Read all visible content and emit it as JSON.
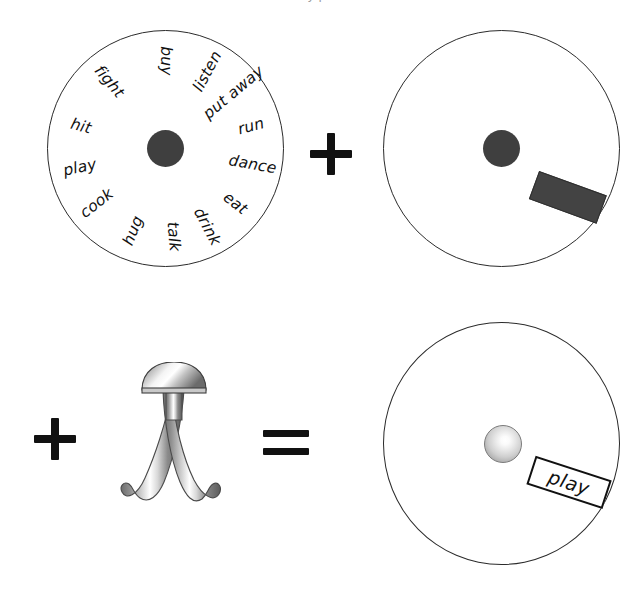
{
  "figure": {
    "caption_fragment": "y p t",
    "background_color": "#ffffff",
    "ink_color": "#111111"
  },
  "operators": {
    "plus_top": "+",
    "plus_bottom": "+",
    "equals": "="
  },
  "panels": {
    "verb_wheel": {
      "name": "verb-wheel",
      "hub_color": "#3f3f3f",
      "words": [
        {
          "label": "buy",
          "angle_deg": -90,
          "flip": true
        },
        {
          "label": "listen",
          "angle_deg": -62,
          "flip": false
        },
        {
          "label": "put away",
          "angle_deg": -40,
          "flip": false
        },
        {
          "label": "run",
          "angle_deg": -15,
          "flip": false
        },
        {
          "label": "dance",
          "angle_deg": 10,
          "flip": false
        },
        {
          "label": "eat",
          "angle_deg": 38,
          "flip": false
        },
        {
          "label": "drink",
          "angle_deg": 62,
          "flip": false
        },
        {
          "label": "talk",
          "angle_deg": 85,
          "flip": false
        },
        {
          "label": "hug",
          "angle_deg": 112,
          "flip": true
        },
        {
          "label": "cook",
          "angle_deg": 142,
          "flip": true
        },
        {
          "label": "play",
          "angle_deg": 168,
          "flip": true
        },
        {
          "label": "hit",
          "angle_deg": -165,
          "flip": true
        },
        {
          "label": "fight",
          "angle_deg": -130,
          "flip": true
        }
      ]
    },
    "pointer_disc": {
      "name": "pointer-disc",
      "hub_color": "#3f3f3f",
      "tile_color": "#434343",
      "tile_rotation_deg": 20
    },
    "hook_tool": {
      "name": "hook-tool",
      "description": "two-pronged metallic hook with dome cap"
    },
    "result_disc": {
      "name": "result-disc",
      "hub_style": "glowing-sphere",
      "label": "play",
      "label_rotation_deg": 18
    }
  }
}
